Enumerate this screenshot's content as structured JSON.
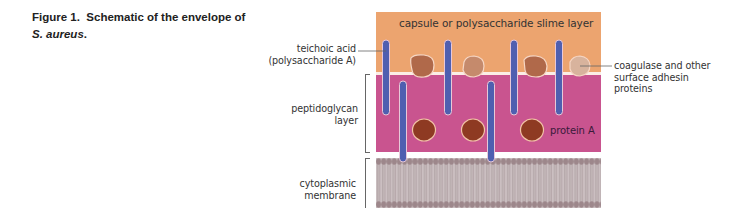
{
  "figure": {
    "caption_prefix": "Figure 1.",
    "caption_text": "Schematic of the envelope of",
    "caption_species": "S. aureus",
    "caption_end": "."
  },
  "labels": {
    "capsule": "capsule or polysaccharide slime layer",
    "teichoic_line1": "teichoic acid",
    "teichoic_line2": "(polysaccharide A)",
    "peptidoglycan_line1": "peptidoglycan",
    "peptidoglycan_line2": "layer",
    "membrane_line1": "cytoplasmic",
    "membrane_line2": "membrane",
    "coagulase_line1": "coagulase and other",
    "coagulase_line2": "surface adhesin",
    "coagulase_line3": "proteins",
    "protein_a": "protein A"
  },
  "colors": {
    "capsule": "#eca46f",
    "peptidoglycan": "#c9548f",
    "teichoic_acid": "#4f5fb0",
    "protein_a": "#8e3a22",
    "surface_protein_dark": "#b0694a",
    "surface_protein_mid": "#c58a6c",
    "surface_protein_light": "#d8b39d",
    "membrane_head": "#9d878b",
    "membrane_tail": "#cbbfc1"
  }
}
